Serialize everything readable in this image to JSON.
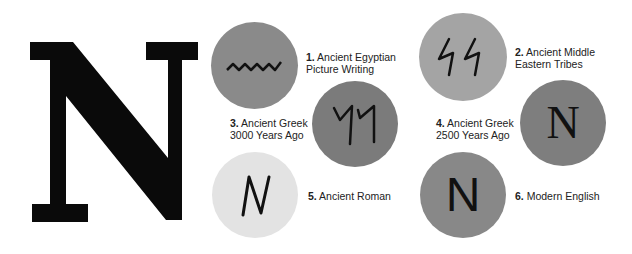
{
  "title_letter": "N",
  "colors": {
    "background": "#ffffff",
    "circle_medium": "#8a8a8a",
    "circle_dark": "#7b7b7b",
    "circle_light_gray": "#a4a4a4",
    "circle_pale": "#e3e3e3",
    "glyph": "#111111"
  },
  "stages": [
    {
      "number": "1.",
      "line1": "Ancient Egyptian",
      "line2": "Picture Writing",
      "glyph": "wavy-line-icon"
    },
    {
      "number": "2.",
      "line1": "Ancient Middle",
      "line2": "Eastern Tribes",
      "glyph": "double-zigzag-icon"
    },
    {
      "number": "3.",
      "line1": "Ancient Greek",
      "line2": "3000 Years Ago",
      "glyph": "double-hook-icon"
    },
    {
      "number": "4.",
      "line1": "Ancient Greek",
      "line2": "2500 Years Ago",
      "glyph": "serif-n-icon",
      "glyph_text": "N"
    },
    {
      "number": "5.",
      "line1": "Ancient Roman",
      "line2": "",
      "glyph": "handwritten-n-icon"
    },
    {
      "number": "6.",
      "line1": "Modern English",
      "line2": "",
      "glyph": "sans-n-icon",
      "glyph_text": "N"
    }
  ]
}
